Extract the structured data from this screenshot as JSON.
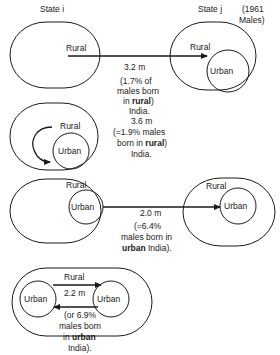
{
  "header": {
    "state_i": "State i",
    "state_j": "State j",
    "year_line1": "(1961",
    "year_line2": "Males)"
  },
  "labels": {
    "rural": "Rural",
    "urban": "Urban"
  },
  "flows": [
    {
      "id": "rural-to-rural-interstate",
      "value": "3.2 m",
      "note_lines": [
        "(1.7% of",
        "males born",
        "in ",
        "rural",
        ")",
        "India."
      ]
    },
    {
      "id": "rural-to-urban-intrastate",
      "value": "3.6 m",
      "note_lines": [
        "(=1.9% males",
        "born in ",
        "rural",
        ")",
        "India."
      ]
    },
    {
      "id": "urban-to-urban-interstate",
      "value": "2.0 m",
      "note_lines": [
        "(=6.4%",
        "males born in",
        "urban",
        " India)."
      ]
    },
    {
      "id": "urban-to-urban-intrastate",
      "value": "2.2 m",
      "note_lines": [
        "(or 6.9%",
        "males born",
        "in ",
        "urban",
        "India)."
      ]
    }
  ],
  "colors": {
    "stroke": "#1a1a1a",
    "background": "#ffffff"
  }
}
